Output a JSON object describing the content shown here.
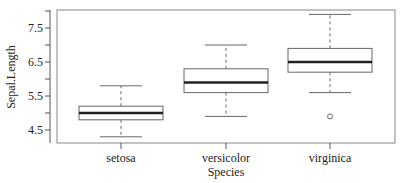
{
  "chart_data": {
    "type": "boxplot",
    "title": "",
    "xlabel": "Species",
    "ylabel": "Sepal.Length",
    "categories": [
      "setosa",
      "versicolor",
      "virginica"
    ],
    "yticks": [
      4.5,
      5.5,
      6.5,
      7.5
    ],
    "ytick_labels": [
      "4.5",
      "5.5",
      "6.5",
      "7.5"
    ],
    "minor_yticks": [
      5.0,
      6.0,
      7.0,
      8.0
    ],
    "ylim": [
      4.15,
      8.05
    ],
    "grid": false,
    "legend": null,
    "boxes": [
      {
        "category": "setosa",
        "whisker_low": 4.3,
        "q1": 4.8,
        "median": 5.0,
        "q3": 5.2,
        "whisker_high": 5.8,
        "outliers": []
      },
      {
        "category": "versicolor",
        "whisker_low": 4.9,
        "q1": 5.6,
        "median": 5.9,
        "q3": 6.3,
        "whisker_high": 7.0,
        "outliers": []
      },
      {
        "category": "virginica",
        "whisker_low": 5.6,
        "q1": 6.2,
        "median": 6.5,
        "q3": 6.9,
        "whisker_high": 7.9,
        "outliers": [
          4.9
        ]
      }
    ]
  },
  "colors": {
    "axis": "#555555",
    "box_line": "#666666",
    "median_line": "#222222",
    "whisker": "#666666"
  }
}
